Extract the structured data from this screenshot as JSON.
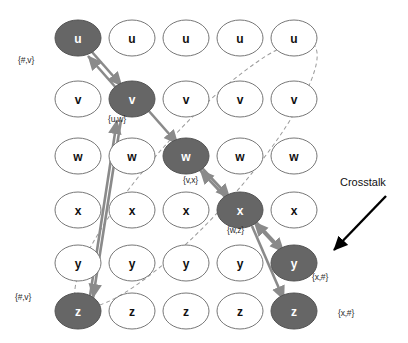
{
  "diagram": {
    "colors": {
      "node_fill_dark": "#666666",
      "node_fill_light": "#ffffff",
      "node_stroke": "#777777",
      "node_stroke_dark": "#555555",
      "edge": "#8a8a8a",
      "ellipse_dash": "#9a9a9a",
      "annotation_arrow": "#000000",
      "label_text": "#2b2b2b",
      "node_text_light": "#ffffff",
      "node_text_dark": "#111111",
      "background": "#ffffff"
    },
    "grid": {
      "columns": 5,
      "rows": 6,
      "row_symbols": [
        "u",
        "v",
        "w",
        "x",
        "y",
        "z"
      ],
      "column_x": [
        78,
        132,
        186,
        240,
        294
      ],
      "row_y": [
        38,
        99,
        156,
        210,
        263,
        311
      ],
      "node_rx": 23,
      "node_ry": 18
    },
    "nodes": [
      {
        "id": "n-c1-r1",
        "label": "u",
        "col": 1,
        "row": 1,
        "highlighted": true
      },
      {
        "id": "n-c2-r1",
        "label": "u",
        "col": 2,
        "row": 1,
        "highlighted": false
      },
      {
        "id": "n-c3-r1",
        "label": "u",
        "col": 3,
        "row": 1,
        "highlighted": false
      },
      {
        "id": "n-c4-r1",
        "label": "u",
        "col": 4,
        "row": 1,
        "highlighted": false
      },
      {
        "id": "n-c5-r1",
        "label": "u",
        "col": 5,
        "row": 1,
        "highlighted": false
      },
      {
        "id": "n-c1-r2",
        "label": "v",
        "col": 1,
        "row": 2,
        "highlighted": false
      },
      {
        "id": "n-c2-r2",
        "label": "v",
        "col": 2,
        "row": 2,
        "highlighted": true
      },
      {
        "id": "n-c3-r2",
        "label": "v",
        "col": 3,
        "row": 2,
        "highlighted": false
      },
      {
        "id": "n-c4-r2",
        "label": "v",
        "col": 4,
        "row": 2,
        "highlighted": false
      },
      {
        "id": "n-c5-r2",
        "label": "v",
        "col": 5,
        "row": 2,
        "highlighted": false
      },
      {
        "id": "n-c1-r3",
        "label": "w",
        "col": 1,
        "row": 3,
        "highlighted": false
      },
      {
        "id": "n-c2-r3",
        "label": "w",
        "col": 2,
        "row": 3,
        "highlighted": false
      },
      {
        "id": "n-c3-r3",
        "label": "w",
        "col": 3,
        "row": 3,
        "highlighted": true
      },
      {
        "id": "n-c4-r3",
        "label": "w",
        "col": 4,
        "row": 3,
        "highlighted": false
      },
      {
        "id": "n-c5-r3",
        "label": "w",
        "col": 5,
        "row": 3,
        "highlighted": false
      },
      {
        "id": "n-c1-r4",
        "label": "x",
        "col": 1,
        "row": 4,
        "highlighted": false
      },
      {
        "id": "n-c2-r4",
        "label": "x",
        "col": 2,
        "row": 4,
        "highlighted": false
      },
      {
        "id": "n-c3-r4",
        "label": "x",
        "col": 3,
        "row": 4,
        "highlighted": false
      },
      {
        "id": "n-c4-r4",
        "label": "x",
        "col": 4,
        "row": 4,
        "highlighted": true
      },
      {
        "id": "n-c5-r4",
        "label": "x",
        "col": 5,
        "row": 4,
        "highlighted": false
      },
      {
        "id": "n-c1-r5",
        "label": "y",
        "col": 1,
        "row": 5,
        "highlighted": false
      },
      {
        "id": "n-c2-r5",
        "label": "y",
        "col": 2,
        "row": 5,
        "highlighted": false
      },
      {
        "id": "n-c3-r5",
        "label": "y",
        "col": 3,
        "row": 5,
        "highlighted": false
      },
      {
        "id": "n-c4-r5",
        "label": "y",
        "col": 4,
        "row": 5,
        "highlighted": false
      },
      {
        "id": "n-c5-r5",
        "label": "y",
        "col": 5,
        "row": 5,
        "highlighted": true
      },
      {
        "id": "n-c1-r6",
        "label": "z",
        "col": 1,
        "row": 6,
        "highlighted": true
      },
      {
        "id": "n-c2-r6",
        "label": "z",
        "col": 2,
        "row": 6,
        "highlighted": false
      },
      {
        "id": "n-c3-r6",
        "label": "z",
        "col": 3,
        "row": 6,
        "highlighted": false
      },
      {
        "id": "n-c4-r6",
        "label": "z",
        "col": 4,
        "row": 6,
        "highlighted": false
      },
      {
        "id": "n-c5-r6",
        "label": "z",
        "col": 5,
        "row": 6,
        "highlighted": true
      }
    ],
    "edge_labels": [
      {
        "id": "lbl-hash-v-top",
        "text": "{#,v}",
        "x": 18,
        "y": 55
      },
      {
        "id": "lbl-u-w",
        "text": "{u,w}",
        "x": 108,
        "y": 114
      },
      {
        "id": "lbl-v-x",
        "text": "{v,x}",
        "x": 183,
        "y": 175
      },
      {
        "id": "lbl-w-z",
        "text": "{w,z}",
        "x": 227,
        "y": 225
      },
      {
        "id": "lbl-x-hash-upper",
        "text": "{x,#}",
        "x": 312,
        "y": 272
      },
      {
        "id": "lbl-x-hash-lower",
        "text": "{x,#}",
        "x": 338,
        "y": 308
      },
      {
        "id": "lbl-hash-v-bottom",
        "text": "{#,v}",
        "x": 15,
        "y": 292
      }
    ],
    "annotations": [
      {
        "id": "annot-crosstalk",
        "text": "Crosstalk",
        "x": 340,
        "y": 176
      }
    ]
  }
}
